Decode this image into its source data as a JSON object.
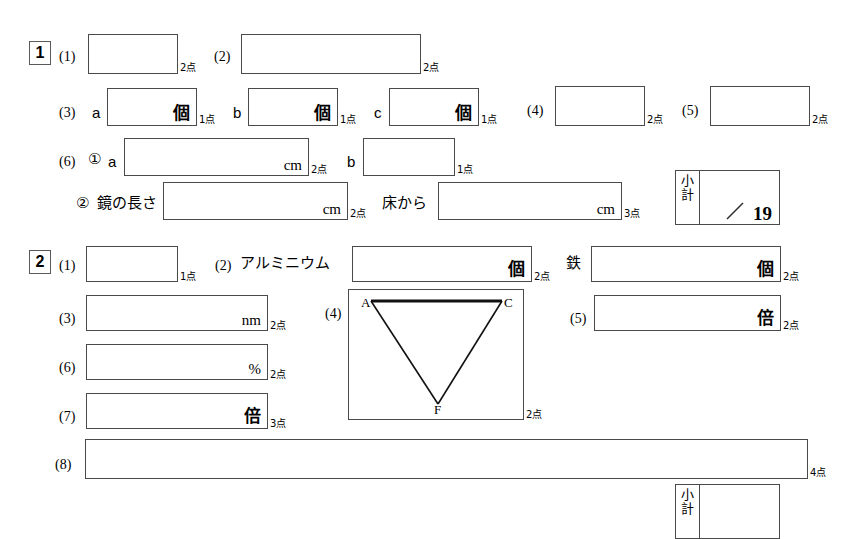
{
  "document": {
    "type": "answer-sheet",
    "language": "ja",
    "background_color": "#ffffff",
    "line_color": "#4a4a4a"
  },
  "sections": [
    {
      "number": "1",
      "rows": [
        {
          "items": [
            {
              "label": "(1)",
              "unit": "",
              "points": "2点"
            },
            {
              "label": "(2)",
              "unit": "",
              "points": "2点"
            }
          ]
        },
        {
          "items": [
            {
              "label": "(3)",
              "sub": "a",
              "unit": "個",
              "points": "1点"
            },
            {
              "sub": "b",
              "unit": "個",
              "points": "1点"
            },
            {
              "sub": "c",
              "unit": "個",
              "points": "1点"
            },
            {
              "label": "(4)",
              "unit": "",
              "points": "2点"
            },
            {
              "label": "(5)",
              "unit": "",
              "points": "2点"
            }
          ]
        },
        {
          "items": [
            {
              "label": "(6)",
              "circled": "①",
              "sub": "a",
              "unit": "cm",
              "points": "2点"
            },
            {
              "sub": "b",
              "unit": "",
              "points": "1点"
            }
          ]
        },
        {
          "items": [
            {
              "circled": "②",
              "sub": "鏡の長さ",
              "unit": "cm",
              "points": "2点"
            },
            {
              "sub": "床から",
              "unit": "cm",
              "points": "3点"
            }
          ]
        }
      ],
      "subtotal": {
        "label_top": "小",
        "label_bottom": "計",
        "max": "19"
      }
    },
    {
      "number": "2",
      "rows": [
        {
          "items": [
            {
              "label": "(1)",
              "unit": "",
              "points": "1点"
            },
            {
              "label": "(2)",
              "sub": "アルミニウム",
              "unit": "個",
              "points": "2点"
            },
            {
              "sub": "鉄",
              "unit": "個",
              "points": "2点"
            }
          ]
        },
        {
          "items": [
            {
              "label": "(3)",
              "unit": "nm",
              "points": "2点"
            },
            {
              "label": "(4)",
              "unit": "",
              "points": "2点",
              "diagram": "triangle"
            },
            {
              "label": "(5)",
              "unit": "倍",
              "points": "2点"
            }
          ]
        },
        {
          "items": [
            {
              "label": "(6)",
              "unit": "%",
              "points": "2点"
            }
          ]
        },
        {
          "items": [
            {
              "label": "(7)",
              "unit": "倍",
              "points": "3点"
            }
          ]
        },
        {
          "items": [
            {
              "label": "(8)",
              "unit": "",
              "points": "4点"
            }
          ]
        }
      ],
      "subtotal": {
        "label_top": "小",
        "label_bottom": "計",
        "max": ""
      }
    }
  ],
  "diagram": {
    "name": "inverted-triangle",
    "vertices": [
      {
        "id": "A",
        "label": "A"
      },
      {
        "id": "C",
        "label": "C"
      },
      {
        "id": "F",
        "label": "F"
      }
    ],
    "bold_edge": "A-C"
  },
  "labels": {
    "s1_num": "1",
    "s2_num": "2",
    "p1": "(1)",
    "p2": "(2)",
    "p3": "(3)",
    "p4": "(4)",
    "p5": "(5)",
    "p6": "(6)",
    "p7": "(7)",
    "p8": "(8)",
    "a": "a",
    "b": "b",
    "c": "c",
    "circ1": "①",
    "circ2": "②",
    "mirror_len": "鏡の長さ",
    "from_floor": "床から",
    "aluminium": "アルミニウム",
    "iron": "鉄",
    "unit_ko": "個",
    "unit_cm": "cm",
    "unit_nm": "nm",
    "unit_pct": "%",
    "unit_bai": "倍",
    "pts1": "1点",
    "pts2": "2点",
    "pts3": "3点",
    "pts4": "4点",
    "sub_top": "小",
    "sub_bottom": "計",
    "sub_max_1": "19",
    "sub_max_2": "",
    "vtx_a": "A",
    "vtx_c": "C",
    "vtx_f": "F"
  }
}
